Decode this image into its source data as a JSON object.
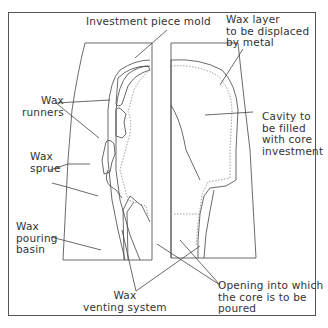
{
  "diagram": {
    "type": "technical illustration",
    "labels": {
      "investment_mold": "Investment piece mold",
      "wax_layer": "Wax layer\nto be displaced\nby metal",
      "wax_runners": "Wax\nrunners",
      "wax_sprue": "Wax\nsprue",
      "cavity": "Cavity to\nbe filled\nwith core\ninvestment",
      "pouring_basin": "Wax\npouring\nbasin",
      "venting": "Wax\nventing system",
      "opening": "Opening into which\nthe core is to be\npoured"
    },
    "colors": {
      "line": "#444444",
      "text": "#333333",
      "dotted": "#888888",
      "background": "#ffffff"
    }
  }
}
